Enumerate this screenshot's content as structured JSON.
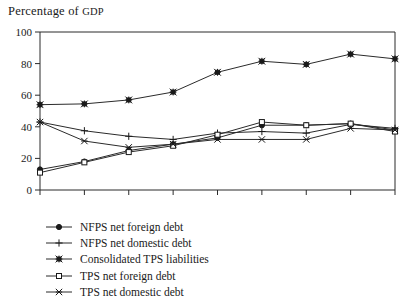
{
  "chart_data": {
    "type": "line",
    "title": "Percentage of GDP",
    "title_main": "Percentage of ",
    "title_smallcaps": "GDP",
    "xlabel": "",
    "ylabel": "",
    "categories": [
      "1980",
      "1981",
      "1982",
      "1983",
      "1984",
      "1985",
      "1986",
      "1987",
      "1988"
    ],
    "x": [
      1980,
      1981,
      1982,
      1983,
      1984,
      1985,
      1986,
      1987,
      1988
    ],
    "ylim": [
      0,
      100
    ],
    "xlim": [
      1980,
      1988
    ],
    "yticks": [
      0,
      20,
      40,
      60,
      80,
      100
    ],
    "ytick_labels": [
      "0",
      "20",
      "40",
      "60",
      "80",
      "100"
    ],
    "xtick_labels": [
      "1980",
      "1981",
      "1982",
      "1983",
      "1984",
      "1985",
      "1986",
      "1987",
      "1988"
    ],
    "grid": false,
    "legend_position": "below-left",
    "series": [
      {
        "name": "NFPS net foreign debt",
        "marker": "filled-circle",
        "values": [
          13,
          18,
          25,
          29,
          33,
          41,
          41,
          42,
          38
        ]
      },
      {
        "name": "NFPS net domestic debt",
        "marker": "plus",
        "values": [
          43,
          37.5,
          34,
          32,
          36,
          37,
          36,
          41.5,
          39
        ]
      },
      {
        "name": "Consolidated TPS liabilities",
        "marker": "filled-asterisk",
        "values": [
          54,
          54.5,
          57,
          62,
          74.5,
          81.5,
          79.5,
          86,
          83
        ]
      },
      {
        "name": "TPS net foreign debt",
        "marker": "open-square",
        "values": [
          11,
          17.5,
          24,
          28,
          35,
          43,
          41,
          42,
          37
        ]
      },
      {
        "name": "TPS net domestic debt",
        "marker": "cross-x",
        "values": [
          43,
          31,
          27,
          29,
          32,
          32,
          32,
          39,
          38
        ]
      }
    ]
  },
  "legend": {
    "items": [
      {
        "label": "NFPS net foreign debt",
        "marker": "filled-circle"
      },
      {
        "label": "NFPS net domestic debt",
        "marker": "plus"
      },
      {
        "label": "Consolidated TPS liabilities",
        "marker": "filled-asterisk"
      },
      {
        "label": "TPS net foreign debt",
        "marker": "open-square"
      },
      {
        "label": "TPS net domestic debt",
        "marker": "cross-x"
      }
    ]
  },
  "colors": {
    "ink": "#1a1a1a",
    "axis": "#2b2b2b",
    "background": "#ffffff"
  }
}
